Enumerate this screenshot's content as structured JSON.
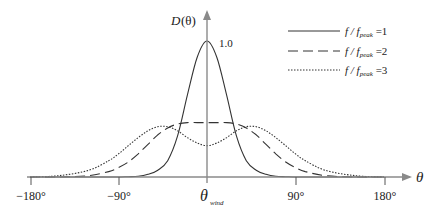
{
  "chart_data": {
    "type": "line",
    "title": "",
    "xlabel": "θ",
    "ylabel": "D(θ)",
    "x_center_label": "θ",
    "x_center_label_sub": "wind",
    "xlim": [
      -180,
      180
    ],
    "ylim": [
      0,
      1.15
    ],
    "grid": false,
    "legend_position": "upper right",
    "peak_annotation": "1.0",
    "x_ticks": [
      -180,
      -90,
      0,
      90,
      180
    ],
    "x_tick_labels": [
      "−180°",
      "−90°",
      "θwind",
      "90°",
      "180°"
    ],
    "x": [
      -180,
      -150,
      -120,
      -100,
      -90,
      -80,
      -70,
      -60,
      -50,
      -40,
      -30,
      -20,
      -10,
      0,
      10,
      20,
      30,
      40,
      50,
      60,
      70,
      80,
      90,
      100,
      120,
      150,
      180
    ],
    "series": [
      {
        "name": "f / f_peak = 1",
        "style": "solid",
        "values": [
          0,
          0,
          0,
          0,
          0,
          0.002,
          0.005,
          0.02,
          0.05,
          0.12,
          0.3,
          0.6,
          0.88,
          1.0,
          0.88,
          0.6,
          0.3,
          0.12,
          0.05,
          0.02,
          0.005,
          0.002,
          0,
          0,
          0,
          0,
          0
        ]
      },
      {
        "name": "f / f_peak = 2",
        "style": "dashed",
        "values": [
          0,
          0,
          0.01,
          0.04,
          0.07,
          0.11,
          0.17,
          0.24,
          0.31,
          0.36,
          0.39,
          0.4,
          0.4,
          0.4,
          0.4,
          0.4,
          0.39,
          0.36,
          0.31,
          0.24,
          0.17,
          0.11,
          0.07,
          0.04,
          0.01,
          0,
          0
        ]
      },
      {
        "name": "f / f_peak = 3",
        "style": "dotted",
        "values": [
          0,
          0.01,
          0.05,
          0.12,
          0.17,
          0.23,
          0.29,
          0.34,
          0.37,
          0.37,
          0.34,
          0.29,
          0.25,
          0.23,
          0.25,
          0.29,
          0.34,
          0.37,
          0.37,
          0.34,
          0.29,
          0.23,
          0.17,
          0.12,
          0.05,
          0.01,
          0
        ]
      }
    ]
  },
  "legend": {
    "items": [
      {
        "prefix": "f / f",
        "sub": "peak",
        "suffix": " =1",
        "style": "solid"
      },
      {
        "prefix": "f / f",
        "sub": "peak",
        "suffix": " =2",
        "style": "dashed"
      },
      {
        "prefix": "f / f",
        "sub": "peak",
        "suffix": " =3",
        "style": "dotted"
      }
    ]
  },
  "axes": {
    "y_label_main": "D",
    "y_label_arg": "(θ)",
    "x_label": "θ",
    "peak_label": "1.0",
    "center_label": "θ",
    "center_sub": "wind",
    "tick_labels": [
      "−180°",
      "−90°",
      "90°",
      "180°"
    ]
  },
  "colors": {
    "axis": "#8a8a8a",
    "curve": "#333333",
    "text": "#222222"
  }
}
